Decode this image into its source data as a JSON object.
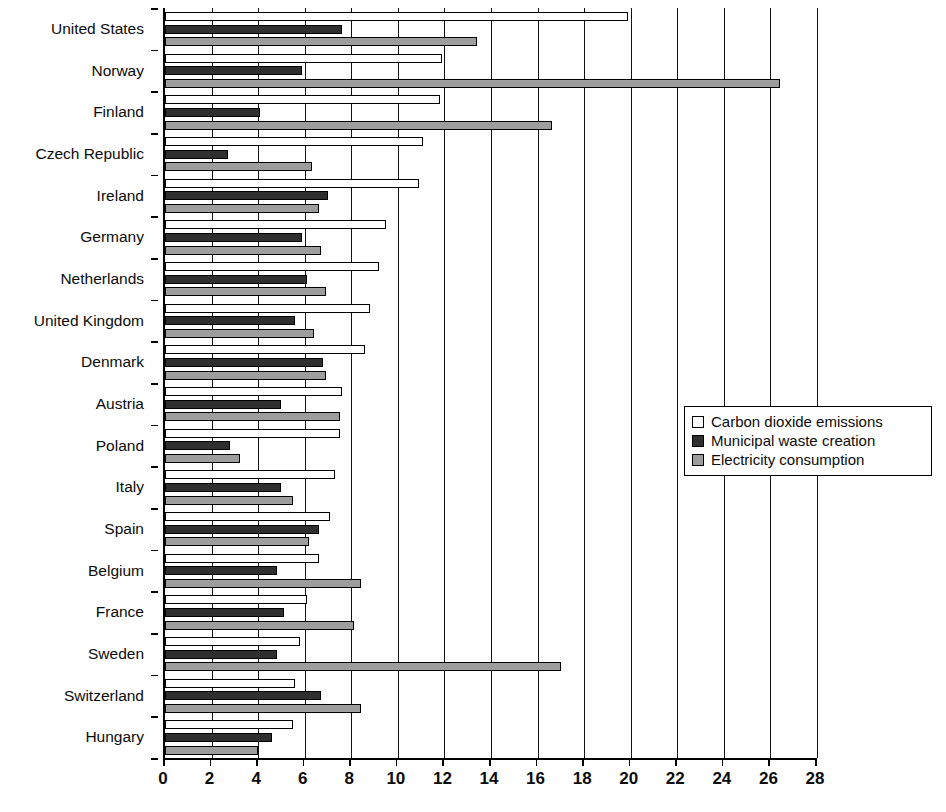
{
  "chart_data": {
    "type": "bar",
    "orientation": "horizontal",
    "title": "",
    "xlabel": "",
    "ylabel": "",
    "xlim": [
      0,
      28
    ],
    "xticks": [
      0,
      2,
      4,
      6,
      8,
      10,
      12,
      14,
      16,
      18,
      20,
      22,
      24,
      26,
      28
    ],
    "grid": true,
    "grid_axis": "x",
    "legend_position": "center-right",
    "categories": [
      "United States",
      "Norway",
      "Finland",
      "Czech Republic",
      "Ireland",
      "Germany",
      "Netherlands",
      "United Kingdom",
      "Denmark",
      "Austria",
      "Poland",
      "Italy",
      "Spain",
      "Belgium",
      "France",
      "Sweden",
      "Switzerland",
      "Hungary"
    ],
    "series": [
      {
        "name": "Carbon dioxide emissions",
        "color": "#ffffff",
        "values": [
          19.9,
          11.9,
          11.8,
          11.1,
          10.9,
          9.5,
          9.2,
          8.8,
          8.6,
          7.6,
          7.5,
          7.3,
          7.1,
          6.6,
          6.1,
          5.8,
          5.6,
          5.5
        ]
      },
      {
        "name": "Municipal waste creation",
        "color": "#2f2f2f",
        "values": [
          7.6,
          5.9,
          4.1,
          2.7,
          7.0,
          5.9,
          6.1,
          5.6,
          6.8,
          5.0,
          2.8,
          5.0,
          6.6,
          4.8,
          5.1,
          4.8,
          6.7,
          4.6
        ]
      },
      {
        "name": "Electricity consumption",
        "color": "#9d9d9d",
        "values": [
          13.4,
          26.4,
          16.6,
          6.3,
          6.6,
          6.7,
          6.9,
          6.4,
          6.9,
          7.5,
          3.2,
          5.5,
          6.2,
          8.4,
          8.1,
          17.0,
          8.4,
          4.0
        ]
      }
    ]
  },
  "legend": {
    "items": [
      {
        "label": "Carbon dioxide emissions",
        "swatch": "co2"
      },
      {
        "label": "Municipal waste creation",
        "swatch": "waste"
      },
      {
        "label": "Electricity consumption",
        "swatch": "elec"
      }
    ]
  }
}
